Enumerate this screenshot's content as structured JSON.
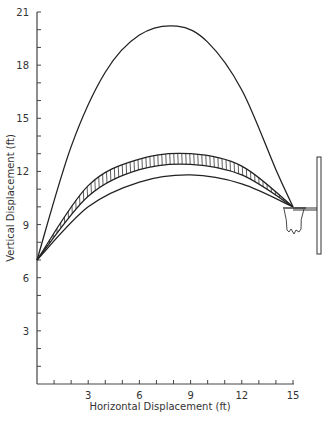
{
  "chart_data": {
    "type": "line",
    "title": "",
    "xlabel": "Horizontal Displacement (ft)",
    "ylabel": "Vertical Displacement (ft)",
    "xlim": [
      0,
      15
    ],
    "ylim": [
      0,
      21
    ],
    "x_ticks": [
      3,
      6,
      9,
      12,
      15
    ],
    "y_ticks": [
      3,
      6,
      9,
      12,
      15,
      18,
      21
    ],
    "x_minor_step": 1,
    "y_minor_step": 1,
    "grid": false,
    "legend": null,
    "series": [
      {
        "name": "High-arc trajectory",
        "style": "solid line",
        "points": [
          [
            0,
            7
          ],
          [
            2,
            13.4
          ],
          [
            4,
            17.6
          ],
          [
            6,
            19.7
          ],
          [
            8.2,
            20.2
          ],
          [
            10,
            19.3
          ],
          [
            12,
            16.6
          ],
          [
            14,
            12.1
          ],
          [
            15,
            10
          ]
        ]
      },
      {
        "name": "Band upper bound",
        "style": "solid line (hatched band top)",
        "points": [
          [
            0,
            7
          ],
          [
            3,
            11.2
          ],
          [
            6,
            12.7
          ],
          [
            9,
            13.0
          ],
          [
            12,
            12.3
          ],
          [
            15,
            10
          ]
        ]
      },
      {
        "name": "Band lower bound",
        "style": "solid line (hatched band bottom)",
        "points": [
          [
            0,
            7
          ],
          [
            3,
            10.6
          ],
          [
            6,
            12.1
          ],
          [
            9,
            12.4
          ],
          [
            12,
            11.8
          ],
          [
            15,
            10
          ]
        ]
      },
      {
        "name": "Low-arc trajectory",
        "style": "solid line",
        "points": [
          [
            0,
            7
          ],
          [
            3,
            10.0
          ],
          [
            6,
            11.4
          ],
          [
            9,
            11.8
          ],
          [
            12,
            11.3
          ],
          [
            15,
            10
          ]
        ]
      }
    ],
    "annotations": [
      {
        "type": "hatched-band",
        "between": [
          "Band upper bound",
          "Band lower bound"
        ],
        "label": "acceptable trajectory range"
      },
      {
        "type": "drawing",
        "label": "basketball hoop with net and backboard",
        "position": {
          "x": 15,
          "y": 10
        }
      }
    ],
    "launch_point": {
      "x": 0,
      "y": 7
    },
    "target_point": {
      "x": 15,
      "y": 10
    }
  },
  "axes": {
    "x_title": "Horizontal Displacement (ft)",
    "y_title": "Vertical Displacement (ft)",
    "x_tick_labels": [
      "3",
      "6",
      "9",
      "12",
      "15"
    ],
    "y_tick_labels": [
      "3",
      "6",
      "9",
      "12",
      "15",
      "18",
      "21"
    ]
  },
  "colors": {
    "line": "#222222",
    "axis": "#444444",
    "text": "#333333",
    "background": "#ffffff"
  }
}
